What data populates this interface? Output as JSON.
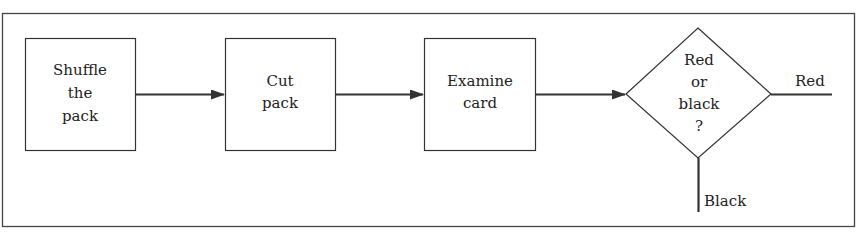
{
  "diagram": {
    "type": "flowchart",
    "colors": {
      "stroke": "#333333",
      "text": "#222222",
      "background": "#ffffff"
    },
    "nodes": [
      {
        "id": "shuffle",
        "shape": "rectangle",
        "lines": [
          "Shuffle",
          "the",
          "pack"
        ]
      },
      {
        "id": "cut",
        "shape": "rectangle",
        "lines": [
          "Cut",
          "pack"
        ]
      },
      {
        "id": "examine",
        "shape": "rectangle",
        "lines": [
          "Examine",
          "card"
        ]
      },
      {
        "id": "decision",
        "shape": "diamond",
        "lines": [
          "Red",
          "or",
          "black",
          "?"
        ]
      }
    ],
    "edges": [
      {
        "from": "shuffle",
        "to": "cut",
        "arrow": true
      },
      {
        "from": "cut",
        "to": "examine",
        "arrow": true
      },
      {
        "from": "examine",
        "to": "decision",
        "arrow": true
      },
      {
        "from": "decision",
        "to": "red-exit",
        "label": "Red"
      },
      {
        "from": "decision",
        "to": "black-exit",
        "label": "Black"
      }
    ],
    "labels": {
      "red": "Red",
      "black": "Black"
    }
  }
}
